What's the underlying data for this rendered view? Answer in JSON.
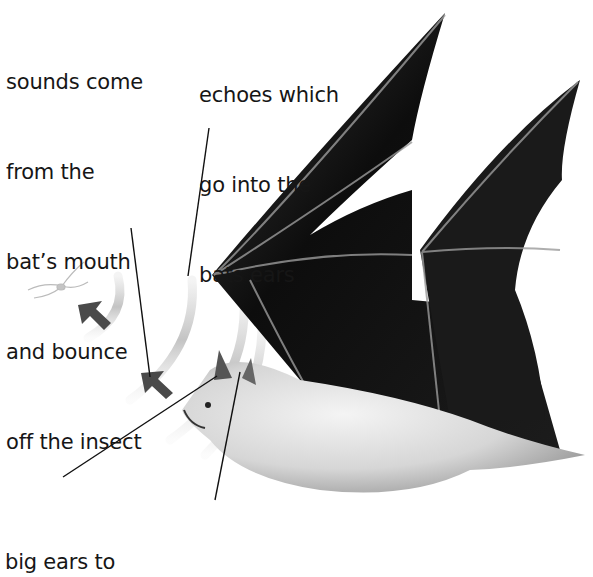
{
  "diagram": {
    "labels": {
      "sounds": [
        "sounds come",
        "from the",
        "bat’s mouth",
        "and bounce",
        "off the insect"
      ],
      "echoes": [
        "echoes which",
        "go into the",
        "bats ears"
      ],
      "big_ears": [
        "big ears to"
      ],
      "cut_off_line": "allow the bat to hear..."
    },
    "elements": [
      "insect",
      "outgoing sound arcs",
      "returning echo arcs",
      "direction arrows",
      "flying bat"
    ],
    "colors": {
      "text": "#161616",
      "arrow": "#4a4a4a",
      "wing": "#111111",
      "fur": "#d8d8d8",
      "arc": "#d0d0d0"
    }
  }
}
